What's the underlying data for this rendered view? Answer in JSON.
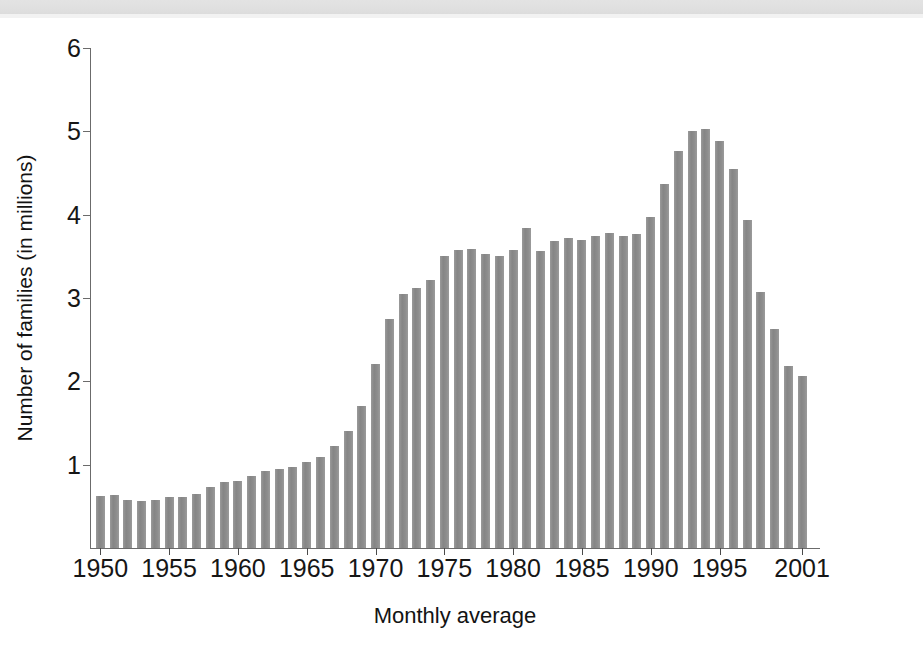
{
  "figure": {
    "background_color": "#ffffff",
    "bar_color": "#8a8a8a",
    "axis_color": "#6b6b6b",
    "scan_strip_color": "#e0e0e0"
  },
  "chart_data": {
    "type": "bar",
    "title": "",
    "xlabel": "Monthly average",
    "ylabel": "Number of families (in millions)",
    "ylim": [
      0,
      6
    ],
    "ytick_labels": [
      "1",
      "2",
      "3",
      "4",
      "5",
      "6"
    ],
    "ytick_values": [
      1,
      2,
      3,
      4,
      5,
      6
    ],
    "xtick_labels": [
      "1950",
      "1955",
      "1960",
      "1965",
      "1970",
      "1975",
      "1980",
      "1985",
      "1990",
      "1995",
      "2001"
    ],
    "xtick_years": [
      1950,
      1955,
      1960,
      1965,
      1970,
      1975,
      1980,
      1985,
      1990,
      1995,
      2001
    ],
    "grid": false,
    "legend": "none",
    "categories": [
      "1950",
      "1951",
      "1952",
      "1953",
      "1954",
      "1955",
      "1956",
      "1957",
      "1958",
      "1959",
      "1960",
      "1961",
      "1962",
      "1963",
      "1964",
      "1965",
      "1966",
      "1967",
      "1968",
      "1969",
      "1970",
      "1971",
      "1972",
      "1973",
      "1974",
      "1975",
      "1976",
      "1977",
      "1978",
      "1979",
      "1980",
      "1981",
      "1982",
      "1983",
      "1984",
      "1985",
      "1986",
      "1987",
      "1988",
      "1989",
      "1990",
      "1991",
      "1992",
      "1993",
      "1994",
      "1995",
      "1996",
      "1997",
      "1998",
      "1999",
      "2000",
      "2001"
    ],
    "values": [
      0.63,
      0.64,
      0.58,
      0.56,
      0.58,
      0.61,
      0.61,
      0.65,
      0.73,
      0.79,
      0.8,
      0.87,
      0.92,
      0.95,
      0.97,
      1.03,
      1.09,
      1.22,
      1.41,
      1.7,
      2.21,
      2.75,
      3.05,
      3.12,
      3.22,
      3.5,
      3.58,
      3.59,
      3.53,
      3.5,
      3.58,
      3.84,
      3.57,
      3.69,
      3.72,
      3.7,
      3.75,
      3.78,
      3.75,
      3.77,
      3.97,
      4.37,
      4.77,
      5.0,
      5.03,
      4.88,
      4.55,
      3.94,
      3.07,
      2.63,
      2.19,
      2.07
    ]
  }
}
